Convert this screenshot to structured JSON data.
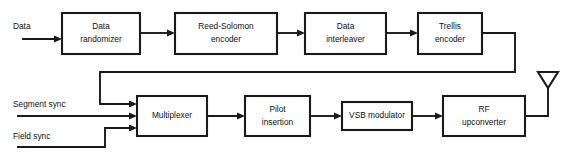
{
  "diagram": {
    "colors": {
      "background": "#ffffff",
      "line": "#1a1a1a",
      "text": "#101010",
      "box_fill": "#ffffff"
    },
    "inputs": [
      {
        "id": "data",
        "label": "Data"
      },
      {
        "id": "segment_sync",
        "label": "Segment sync"
      },
      {
        "id": "field_sync",
        "label": "Field sync"
      }
    ],
    "blocks": [
      {
        "id": "data_randomizer",
        "line1": "Data",
        "line2": "randomizer"
      },
      {
        "id": "reed_solomon_encoder",
        "line1": "Reed-Solomon",
        "line2": "encoder"
      },
      {
        "id": "data_interleaver",
        "line1": "Data",
        "line2": "interleaver"
      },
      {
        "id": "trellis_encoder",
        "line1": "Trellis",
        "line2": "encoder"
      },
      {
        "id": "multiplexer",
        "line1": "Multiplexer",
        "line2": ""
      },
      {
        "id": "pilot_insertion",
        "line1": "Pilot",
        "line2": "insertion"
      },
      {
        "id": "vsb_modulator",
        "line1": "VSB modulator",
        "line2": ""
      },
      {
        "id": "rf_upconverter",
        "line1": "RF",
        "line2": "upconverter"
      }
    ],
    "output": {
      "id": "antenna",
      "label": "antenna"
    }
  }
}
